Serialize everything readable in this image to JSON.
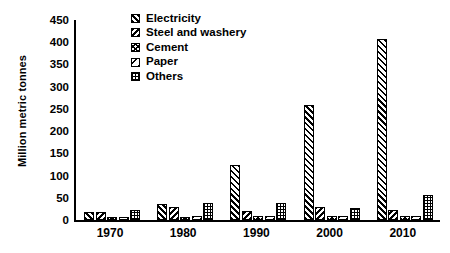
{
  "chart_data": {
    "type": "bar",
    "title": "",
    "xlabel": "",
    "ylabel": "Million metric tonnes",
    "ylim": [
      0,
      450
    ],
    "yticks": [
      0,
      50,
      100,
      150,
      200,
      250,
      300,
      350,
      400,
      450
    ],
    "grid": false,
    "legend_position": "top-center",
    "categories": [
      "1970",
      "1980",
      "1990",
      "2000",
      "2010"
    ],
    "series": [
      {
        "name": "Electricity",
        "pattern": "diagonal-forward",
        "values": [
          18,
          35,
          123,
          258,
          408
        ]
      },
      {
        "name": "Steel and washery",
        "pattern": "diagonal-back",
        "values": [
          17,
          30,
          20,
          30,
          22
        ]
      },
      {
        "name": "Cement",
        "pattern": "cross-hatch",
        "values": [
          6,
          7,
          8,
          9,
          8
        ]
      },
      {
        "name": "Paper",
        "pattern": "sparse-diagonal",
        "values": [
          7,
          9,
          8,
          10,
          9
        ]
      },
      {
        "name": "Others",
        "pattern": "dotted-grid",
        "values": [
          22,
          38,
          38,
          28,
          57
        ]
      }
    ]
  },
  "legend": {
    "items": [
      {
        "label": "Electricity"
      },
      {
        "label": "Steel and washery"
      },
      {
        "label": "Cement"
      },
      {
        "label": "Paper"
      },
      {
        "label": "Others"
      }
    ]
  }
}
